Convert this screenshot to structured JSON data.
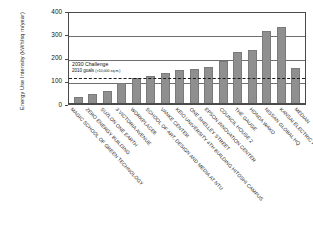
{
  "chart_data": {
    "type": "bar",
    "title": "",
    "xlabel": "",
    "ylabel": "Energy Use Intensity (kWh/sq m/year)",
    "ylim": [
      0,
      400
    ],
    "yticks": [
      0,
      100,
      200,
      300,
      400
    ],
    "grid": true,
    "legend": "none",
    "categories": [
      "MAGIC SCHOOL OF GREEN TECHNOLOGY",
      "ZERO ENERGY BUILDING",
      "SUZLON ONE EARTH",
      "3 VICTORIA AVENUE",
      "WORKPLACE6",
      "SCHOOL OF ART, DESIGN AND MEDIA AT NTU",
      "VANKE CENTER",
      "KEIO UNIVERSITY 4TH BUILDING HITOSHI CAMPUS",
      "ONE SHELLEY STREET",
      "EPSON INNOVATION CENTER",
      "COUNCIL HOUSE 2",
      "THE GAUGE",
      "HONDA WAKO",
      "NISSAN GLOBAL HQ",
      "KANSAI ELECTRIC POWER HQ",
      "MEDIAN"
    ],
    "values": [
      30,
      42,
      57,
      92,
      113,
      122,
      132,
      148,
      150,
      160,
      185,
      222,
      233,
      315,
      330,
      155
    ],
    "annotations": [
      {
        "name": "threshold-2030-challenge",
        "line1": "2030 Challenge",
        "line2": "2010 goals",
        "line2_sub": "(>10,000 sq.m.)",
        "value": 120,
        "style": "dashed"
      }
    ],
    "bar_color": "#8f8f8f",
    "axis_color": "#4a4a4a",
    "grid_color": "#6f6f6f",
    "threshold_color": "#1c1c1c"
  }
}
